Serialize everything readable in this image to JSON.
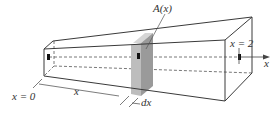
{
  "diagram": {
    "type": "solid-cross-section-volume",
    "labels": {
      "area": "A(x)",
      "start": "x = 0",
      "end": "x = 2",
      "position": "x",
      "thickness": "dx",
      "axis": "x"
    },
    "colors": {
      "edge": "#3a3a3a",
      "dashed": "#555555",
      "slice_front": "#bdbdbd",
      "slice_side": "#9a9a9a",
      "slice_top": "#d6d6d6",
      "background": "#ffffff"
    }
  }
}
